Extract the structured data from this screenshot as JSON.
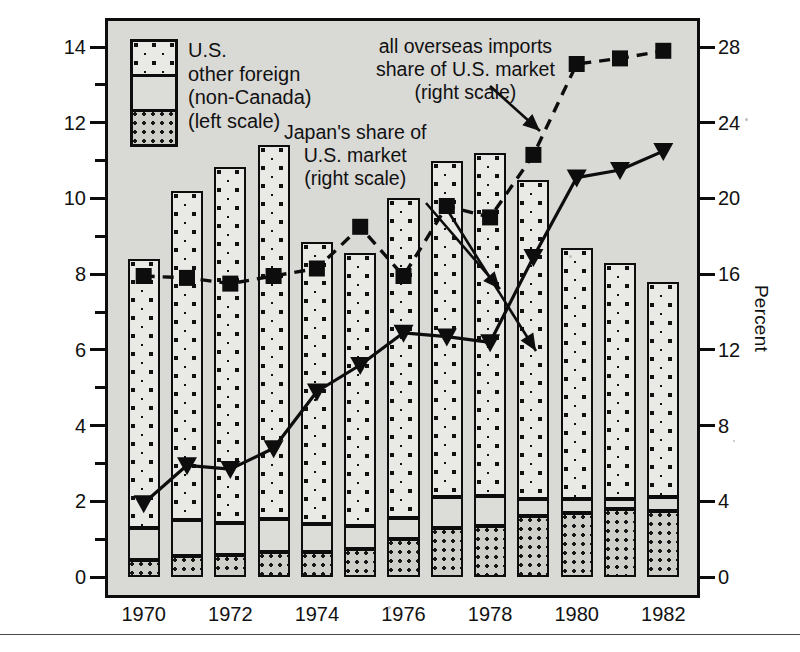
{
  "chart_data": {
    "type": "bar",
    "title": "",
    "subtitle": "",
    "xlabel": "",
    "ylabel": "Million units",
    "y2label": "Percent",
    "categories": [
      1970,
      1971,
      1972,
      1973,
      1974,
      1975,
      1976,
      1977,
      1978,
      1979,
      1980,
      1981,
      1982
    ],
    "ylim": [
      0,
      15
    ],
    "y2lim": [
      0,
      30
    ],
    "yticks": [
      0,
      2,
      4,
      6,
      8,
      10,
      12,
      14
    ],
    "yticks_minor": [
      1,
      3,
      5,
      7,
      9,
      11,
      13
    ],
    "y2ticks": [
      0,
      4,
      8,
      12,
      16,
      20,
      24,
      28
    ],
    "xticks": [
      1970,
      1972,
      1974,
      1976,
      1978,
      1980,
      1982
    ],
    "grid": false,
    "legend_position": "top-left",
    "stacked": true,
    "series": [
      {
        "name": "Japan",
        "key": "japan",
        "kind": "bar-segment",
        "order": 0,
        "scale": "left",
        "values": [
          0.45,
          0.55,
          0.58,
          0.67,
          0.65,
          0.75,
          1.0,
          1.3,
          1.35,
          1.6,
          1.7,
          1.8,
          1.75
        ]
      },
      {
        "name": "other foreign (non-Canada)",
        "key": "other_foreign",
        "kind": "bar-segment",
        "order": 1,
        "scale": "left",
        "values": [
          0.85,
          0.95,
          0.85,
          0.85,
          0.75,
          0.6,
          0.55,
          0.8,
          0.8,
          0.45,
          0.35,
          0.25,
          0.35
        ]
      },
      {
        "name": "U.S.",
        "key": "us",
        "kind": "bar-segment",
        "order": 2,
        "scale": "left",
        "values": [
          7.1,
          8.7,
          9.4,
          9.9,
          7.45,
          7.2,
          8.45,
          8.9,
          9.05,
          8.45,
          6.65,
          6.25,
          5.7
        ]
      },
      {
        "name": "all overseas imports share of U.S. market",
        "key": "overseas_share",
        "kind": "line",
        "style": "dashed",
        "marker": "square",
        "scale": "right",
        "values": [
          15.9,
          15.8,
          15.5,
          15.9,
          16.3,
          18.5,
          15.9,
          19.6,
          19.0,
          22.3,
          27.1,
          27.4,
          27.8
        ]
      },
      {
        "name": "Japan's share of U.S. market",
        "key": "japan_share",
        "kind": "line",
        "style": "solid",
        "marker": "triangle-down",
        "scale": "right",
        "values": [
          3.9,
          5.9,
          5.7,
          6.8,
          9.8,
          11.2,
          12.9,
          12.7,
          12.4,
          16.9,
          21.1,
          21.5,
          22.5
        ]
      }
    ],
    "bar_totals": [
      8.4,
      10.2,
      10.83,
      11.42,
      8.85,
      8.55,
      10.0,
      11.0,
      11.2,
      10.5,
      8.7,
      8.3,
      7.8
    ],
    "annotations": [
      {
        "id": "overseas",
        "lines": [
          "all overseas imports",
          "share of U.S. market",
          "(right scale)"
        ],
        "points_to": "overseas_share",
        "arrow": true
      },
      {
        "id": "japan",
        "lines": [
          "Japan's share of",
          "U.S. market",
          "(right scale)"
        ],
        "points_to": "japan_share",
        "arrow": true
      }
    ],
    "legend_entries": [
      {
        "label": "U.S.",
        "swatch": "us"
      },
      {
        "label": "other foreign",
        "swatch": "other_foreign"
      },
      {
        "label": "(non-Canada)",
        "swatch": "other_foreign"
      },
      {
        "label": "(left scale)",
        "swatch": "japan"
      }
    ]
  },
  "axes": {
    "left_title": "Million units",
    "right_title": "Percent",
    "left_tick_labels": [
      "14",
      "12",
      "10",
      "8",
      "6",
      "4",
      "2",
      "0"
    ],
    "right_tick_labels": [
      "28",
      "24",
      "20",
      "16",
      "12",
      "8",
      "4",
      "0"
    ],
    "x_tick_labels": [
      "1970",
      "1972",
      "1974",
      "1976",
      "1978",
      "1980",
      "1982"
    ]
  },
  "legend": {
    "line1": "U.S.",
    "line2": "other foreign",
    "line3": "(non-Canada)",
    "line4": "(left scale)"
  },
  "annotations": {
    "overseas": "all overseas imports\nshare of U.S. market\n(right scale)",
    "japan": "Japan's share of\nU.S. market\n(right scale)"
  },
  "colors": {
    "ink": "#0d0d0d",
    "plot_background": "#d9d9d6",
    "page_background": "#ffffff",
    "us_fill": "#e9e9e6",
    "other_fill": "#dcdcd8",
    "japan_fill": "#cfcfca"
  }
}
